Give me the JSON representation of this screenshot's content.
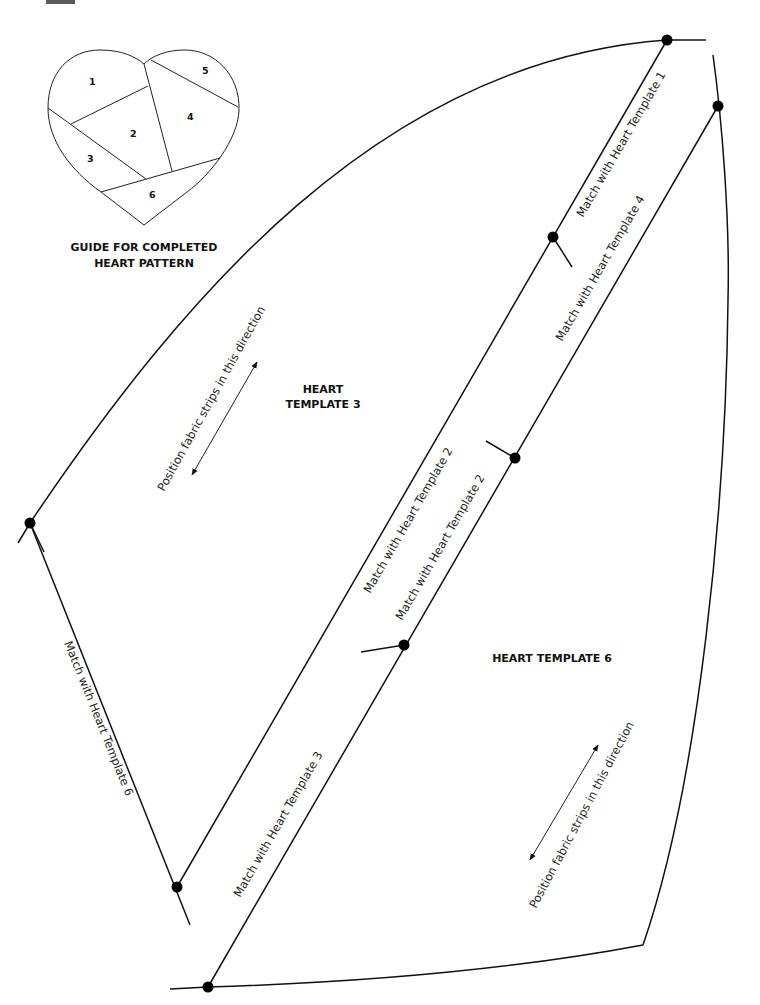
{
  "guide": {
    "title_line1": "GUIDE FOR COMPLETED",
    "title_line2": "HEART PATTERN",
    "pieces": [
      "1",
      "2",
      "3",
      "4",
      "5",
      "6"
    ]
  },
  "templates": {
    "template3": {
      "line1": "HEART",
      "line2": "TEMPLATE 3"
    },
    "template6": {
      "label": "HEART TEMPLATE 6"
    }
  },
  "edge_labels": {
    "match_template1": "Match with Heart Template 1",
    "match_template4": "Match with Heart Template 4",
    "match_template2_a": "Match with Heart Template 2",
    "match_template2_b": "Match with Heart Template 2",
    "match_template6": "Match with Heart Template 6",
    "match_template3": "Match with Heart Template 3"
  },
  "grain_labels": {
    "template3": "Position fabric strips in this direction",
    "template6": "Position fabric strips in this direction"
  },
  "colors": {
    "line": "#111111",
    "background": "#ffffff",
    "corner_tab": "#5a5a5a"
  }
}
